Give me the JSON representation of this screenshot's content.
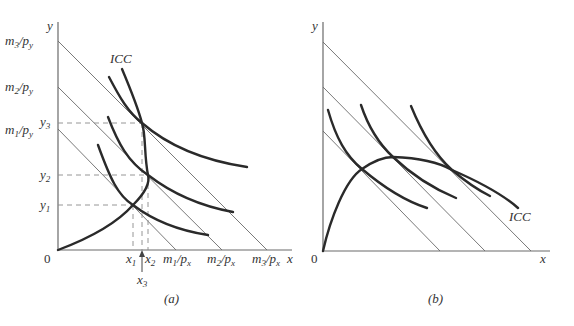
{
  "figure": {
    "panels": [
      {
        "id": "a",
        "caption": "(a)",
        "axes": {
          "x_label": "x",
          "y_label": "y",
          "origin_label": "0"
        },
        "y_intercepts": [
          {
            "m": "m",
            "sub": "3",
            "slash": "/",
            "p": "p",
            "psub": "y"
          },
          {
            "m": "m",
            "sub": "2",
            "slash": "/",
            "p": "p",
            "psub": "y"
          },
          {
            "m": "m",
            "sub": "1",
            "slash": "/",
            "p": "p",
            "psub": "y"
          }
        ],
        "x_intercepts": [
          {
            "m": "m",
            "sub": "1",
            "slash": "/",
            "p": "p",
            "psub": "x"
          },
          {
            "m": "m",
            "sub": "2",
            "slash": "/",
            "p": "p",
            "psub": "x"
          },
          {
            "m": "m",
            "sub": "3",
            "slash": "/",
            "p": "p",
            "psub": "x"
          }
        ],
        "y_ticks": [
          {
            "base": "y",
            "sub": "3"
          },
          {
            "base": "y",
            "sub": "2"
          },
          {
            "base": "y",
            "sub": "1"
          }
        ],
        "x_ticks": [
          {
            "base": "x",
            "sub": "1"
          },
          {
            "base": "x",
            "sub": "2"
          },
          {
            "base": "x",
            "sub": "3"
          }
        ],
        "curve_label": "ICC"
      },
      {
        "id": "b",
        "caption": "(b)",
        "axes": {
          "x_label": "x",
          "y_label": "y",
          "origin_label": "0"
        },
        "curve_label": "ICC"
      }
    ]
  }
}
